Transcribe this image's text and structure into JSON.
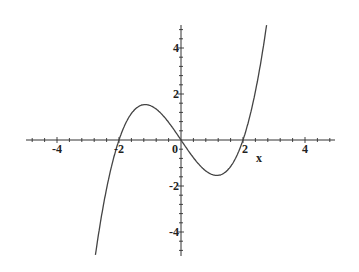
{
  "chart_data": {
    "type": "line",
    "title": "",
    "function": "f(x) = (x^3 - 4x) / 2",
    "xlabel": "x",
    "ylabel": "",
    "xlim": [
      -5,
      5
    ],
    "ylim": [
      -5,
      5
    ],
    "grid": false,
    "legend": null,
    "x_ticks": [
      -4,
      -2,
      0,
      2,
      4
    ],
    "y_ticks": [
      -4,
      -2,
      2,
      4
    ],
    "x_tick_labels": [
      "-4",
      "-2",
      "0",
      "2",
      "4"
    ],
    "y_tick_labels": [
      "-4",
      "-2",
      "2",
      "4"
    ],
    "minor_tick_step": 0.4,
    "series": [
      {
        "name": "f(x)",
        "color": "#444444",
        "x": [
          -2.77,
          -2.5,
          -2.0,
          -1.5,
          -1.155,
          -1.0,
          -0.5,
          0.0,
          0.5,
          1.0,
          1.155,
          1.5,
          2.0,
          2.5,
          2.77
        ],
        "y": [
          -5.08,
          -2.81,
          0.0,
          1.31,
          1.54,
          1.5,
          0.94,
          0.0,
          -0.94,
          -1.5,
          -1.54,
          -1.31,
          0.0,
          2.81,
          5.08
        ]
      }
    ],
    "annotations": [
      {
        "text": "local max",
        "x": -1.155,
        "y": 1.54
      },
      {
        "text": "local min",
        "x": 1.155,
        "y": -1.54
      }
    ],
    "roots": [
      -2,
      0,
      2
    ]
  },
  "labels": {
    "x_axis_name": "x",
    "origin": "0",
    "xneg4": "-4",
    "xneg2": "-2",
    "xpos2": "2",
    "xpos4": "4",
    "ypos4": "4",
    "ypos2": "2",
    "yneg2": "-2",
    "yneg4": "-4"
  }
}
